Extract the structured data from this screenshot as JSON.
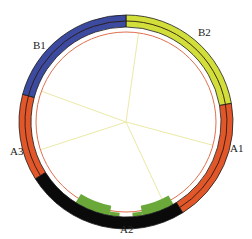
{
  "diagram": {
    "type": "circular-ring",
    "center": [
      126,
      122
    ],
    "outer_radius": 107,
    "inner_radius": 95,
    "guide_circle_radius": 90,
    "segments": [
      {
        "id": "B2",
        "label": "B2",
        "start_deg": 0,
        "end_deg": 80,
        "color": "#d2de3a"
      },
      {
        "id": "A1",
        "label": "A1",
        "start_deg": 80,
        "end_deg": 148,
        "color": "#e2572a"
      },
      {
        "id": "A2",
        "label": "A2",
        "start_deg": 148,
        "end_deg": 238,
        "color": "#0a0a0a"
      },
      {
        "id": "A3",
        "label": "A3",
        "start_deg": 238,
        "end_deg": 285,
        "color": "#e2572a"
      },
      {
        "id": "B1",
        "label": "B1",
        "start_deg": 285,
        "end_deg": 360,
        "color": "#3c4aa0"
      }
    ],
    "labels": [
      {
        "text": "B1",
        "x": 33,
        "y": 49
      },
      {
        "text": "B2",
        "x": 198,
        "y": 36
      },
      {
        "text": "A1",
        "x": 230,
        "y": 152
      },
      {
        "text": "A2",
        "x": 120,
        "y": 233
      },
      {
        "text": "A3",
        "x": 10,
        "y": 155
      }
    ],
    "spokes_deg": [
      8,
      105,
      155,
      252,
      290
    ],
    "colors": {
      "spoke": "#ece9a6",
      "guide_circle": "#e07050",
      "divider": "#2a1a10",
      "green_band": "#6aa83a"
    }
  }
}
